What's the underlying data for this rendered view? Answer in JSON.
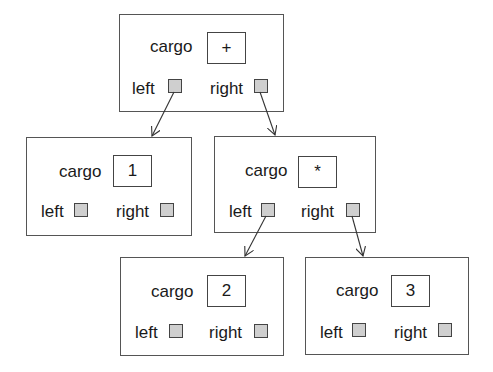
{
  "diagram": {
    "type": "binary expression tree",
    "labels": {
      "cargo": "cargo",
      "left": "left",
      "right": "right"
    },
    "nodes": [
      {
        "id": "root",
        "cargo": "+",
        "left": "n1",
        "right": "mul"
      },
      {
        "id": "n1",
        "cargo": "1",
        "left": null,
        "right": null
      },
      {
        "id": "mul",
        "cargo": "*",
        "left": "n2",
        "right": "n3"
      },
      {
        "id": "n2",
        "cargo": "2",
        "left": null,
        "right": null
      },
      {
        "id": "n3",
        "cargo": "3",
        "left": null,
        "right": null
      }
    ],
    "edges": [
      {
        "from": "root.left",
        "to": "n1"
      },
      {
        "from": "root.right",
        "to": "mul"
      },
      {
        "from": "mul.left",
        "to": "n2"
      },
      {
        "from": "mul.right",
        "to": "n3"
      }
    ],
    "colors": {
      "border": "#555555",
      "pointer_fill": "#cfcfcf",
      "text": "#1a1a1a"
    }
  }
}
